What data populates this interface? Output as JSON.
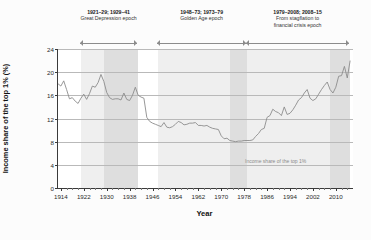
{
  "chart_data": {
    "type": "line",
    "title": "",
    "xlabel": "Year",
    "ylabel": "Income share of the top 1% (%)",
    "xlim": [
      1913,
      2016
    ],
    "ylim": [
      0,
      24
    ],
    "yticks": [
      0,
      4,
      8,
      12,
      16,
      20,
      24
    ],
    "xticks": [
      1914,
      1922,
      1930,
      1938,
      1946,
      1954,
      1962,
      1970,
      1978,
      1986,
      1994,
      2002,
      2010
    ],
    "grid": true,
    "legend_position": "inline",
    "line_color": "#8c8c8c",
    "series": [
      {
        "name": "Income share of the top 1%",
        "x": [
          1913,
          1914,
          1915,
          1916,
          1917,
          1918,
          1919,
          1920,
          1921,
          1922,
          1923,
          1924,
          1925,
          1926,
          1927,
          1928,
          1929,
          1930,
          1931,
          1932,
          1933,
          1934,
          1935,
          1936,
          1937,
          1938,
          1939,
          1940,
          1941,
          1942,
          1943,
          1944,
          1945,
          1946,
          1947,
          1948,
          1949,
          1950,
          1951,
          1952,
          1953,
          1954,
          1955,
          1956,
          1957,
          1958,
          1959,
          1960,
          1961,
          1962,
          1963,
          1964,
          1965,
          1966,
          1967,
          1968,
          1969,
          1970,
          1971,
          1972,
          1973,
          1974,
          1975,
          1976,
          1977,
          1978,
          1979,
          1980,
          1981,
          1982,
          1983,
          1984,
          1985,
          1986,
          1987,
          1988,
          1989,
          1990,
          1991,
          1992,
          1993,
          1994,
          1995,
          1996,
          1997,
          1998,
          1999,
          2000,
          2001,
          2002,
          2003,
          2004,
          2005,
          2006,
          2007,
          2008,
          2009,
          2010,
          2011,
          2012,
          2013,
          2014,
          2015
        ],
        "y": [
          18.0,
          17.6,
          18.5,
          17.0,
          15.4,
          15.6,
          15.0,
          14.6,
          15.5,
          16.2,
          15.3,
          16.3,
          17.6,
          17.4,
          18.2,
          19.6,
          18.4,
          16.5,
          15.6,
          15.3,
          15.4,
          15.4,
          15.2,
          16.4,
          15.3,
          15.1,
          16.0,
          17.4,
          16.0,
          15.7,
          15.5,
          12.2,
          11.5,
          11.2,
          11.0,
          10.8,
          10.6,
          11.3,
          10.5,
          10.4,
          10.6,
          11.0,
          11.5,
          11.3,
          10.9,
          11.0,
          11.2,
          11.2,
          11.3,
          10.8,
          10.8,
          10.7,
          10.8,
          10.5,
          10.3,
          10.2,
          10.1,
          9.0,
          8.5,
          8.6,
          8.2,
          8.1,
          8.0,
          8.1,
          8.1,
          8.2,
          8.2,
          8.2,
          8.3,
          8.9,
          9.4,
          10.1,
          10.3,
          12.2,
          12.5,
          13.6,
          13.2,
          13.0,
          12.5,
          14.0,
          12.7,
          12.9,
          13.5,
          14.3,
          15.2,
          15.6,
          16.4,
          17.0,
          15.5,
          15.1,
          15.4,
          16.2,
          17.0,
          17.7,
          18.3,
          17.0,
          16.4,
          17.4,
          19.3,
          19.4,
          21.0,
          19.0,
          22.0
        ]
      }
    ],
    "shaded_bands": [
      {
        "label": "1921-29",
        "start": 1921,
        "end": 1929,
        "shade": "light"
      },
      {
        "label": "1929-41",
        "start": 1929,
        "end": 1941,
        "shade": "dark"
      },
      {
        "label": "1948-73",
        "start": 1948,
        "end": 1973,
        "shade": "light"
      },
      {
        "label": "1973-79",
        "start": 1973,
        "end": 1979,
        "shade": "dark"
      },
      {
        "label": "1979-2008",
        "start": 1979,
        "end": 2008,
        "shade": "light"
      },
      {
        "label": "2008-15",
        "start": 2008,
        "end": 2015,
        "shade": "dark"
      }
    ],
    "annotations": [
      {
        "years": "1921–29; 1929–41",
        "name": "Great Depression epoch",
        "name_line2": "",
        "span_start": 1921,
        "span_end": 1941
      },
      {
        "years": "1948–73; 1973–79",
        "name": "Golden Age epoch",
        "name_line2": "",
        "span_start": 1948,
        "span_end": 1979
      },
      {
        "years": "1979–2008; 2008–15",
        "name": "From stagflation to",
        "name_line2": "financial crisis epoch",
        "span_start": 1979,
        "span_end": 2015
      }
    ],
    "inline_label": {
      "text": "Income share of the top 1%",
      "x": 1989,
      "y": 4.6
    }
  }
}
